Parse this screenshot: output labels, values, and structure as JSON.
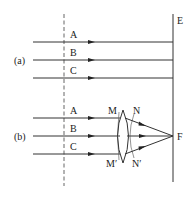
{
  "diagram": {
    "screen_label": "E",
    "part_a": {
      "label": "(a)",
      "rays": [
        {
          "label": "A"
        },
        {
          "label": "B"
        },
        {
          "label": "C"
        }
      ]
    },
    "part_b": {
      "label": "(b)",
      "rays": [
        {
          "label": "A"
        },
        {
          "label": "B"
        },
        {
          "label": "C"
        }
      ],
      "lens_labels": {
        "top_left": "M",
        "top_right": "N",
        "bottom_left": "M′",
        "bottom_right": "N′"
      },
      "focus_label": "F"
    },
    "colors": {
      "line": "#333333",
      "background": "#ffffff"
    }
  }
}
